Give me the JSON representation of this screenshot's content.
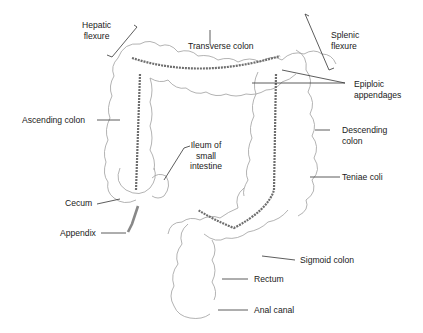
{
  "figure": {
    "colors": {
      "outline": "#9a9a9a",
      "teniae": "#6e6e6e",
      "leader": "#333333",
      "text": "#1a1a1a",
      "background": "#ffffff"
    },
    "labels": {
      "hepatic_flexure": [
        "Hepatic",
        "flexure"
      ],
      "transverse_colon": "Transverse colon",
      "splenic_flexure": [
        "Splenic",
        "flexure"
      ],
      "epiploic_appendages": [
        "Epiploic",
        "appendages"
      ],
      "ascending_colon": "Ascending colon",
      "descending_colon": [
        "Descending",
        "colon"
      ],
      "ileum": [
        "Ileum of",
        "small",
        "intestine"
      ],
      "teniae_coli": "Teniae coli",
      "cecum": "Cecum",
      "appendix": "Appendix",
      "sigmoid_colon": "Sigmoid colon",
      "rectum": "Rectum",
      "anal_canal": "Anal canal"
    }
  }
}
